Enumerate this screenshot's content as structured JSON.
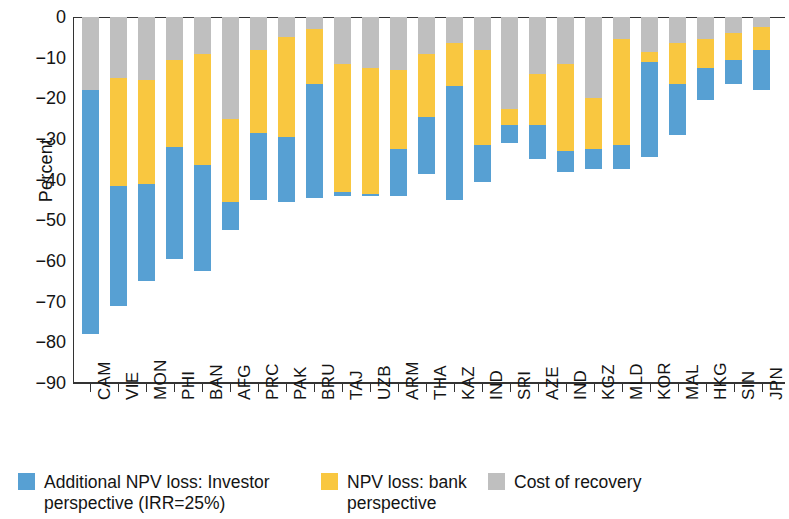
{
  "chart_data": {
    "type": "bar",
    "stacked": true,
    "orientation": "vertical",
    "title": "",
    "xlabel": "",
    "ylabel": "Percent",
    "ylim": [
      -90,
      0
    ],
    "yticks": [
      "0",
      "−10",
      "−20",
      "−30",
      "−40",
      "−50",
      "−60",
      "−70",
      "−80",
      "−90"
    ],
    "ytick_values": [
      0,
      -10,
      -20,
      -30,
      -40,
      -50,
      -60,
      -70,
      -80,
      -90
    ],
    "grid": false,
    "legend_position": "bottom",
    "categories": [
      "CAM",
      "VIE",
      "MON",
      "PHI",
      "BAN",
      "AFG",
      "PRC",
      "PAK",
      "BRU",
      "TAJ",
      "UZB",
      "ARM",
      "THA",
      "KAZ",
      "IND",
      "SRI",
      "AZE",
      "IND",
      "KGZ",
      "MLD",
      "KOR",
      "MAL",
      "HKG",
      "SIN",
      "JPN"
    ],
    "series": [
      {
        "name": "Cost of recovery",
        "color": "#bfbfbf",
        "values": [
          -18,
          -15,
          -15.5,
          -10.5,
          -9,
          -25,
          -8,
          -5,
          -3,
          -11.5,
          -12.5,
          -13,
          -9,
          -6.5,
          -8,
          -22.5,
          -14,
          -11.5,
          -20,
          -5.5,
          -8.5,
          -6.5,
          -5.5,
          -4,
          -2.5
        ]
      },
      {
        "name": "NPV loss: bank perspective",
        "color": "#f9c740",
        "values": [
          0,
          -26.5,
          -25.5,
          -21.5,
          -27.5,
          -20.5,
          -20.5,
          -24.5,
          -13.5,
          -31.5,
          -31,
          -19.5,
          -15.5,
          -10.5,
          -23.5,
          -4,
          -12.5,
          -21.5,
          -12.5,
          -26,
          -2.5,
          -10,
          -7,
          -6.5,
          -5.5
        ]
      },
      {
        "name": "Additional NPV loss: Investor perspective (IRR=25%)",
        "color": "#57a0d3",
        "values": [
          -60,
          -29.5,
          -24,
          -27.5,
          -26,
          -7,
          -16.5,
          -16,
          -28,
          -1,
          -0.5,
          -11.5,
          -14,
          -28,
          -9,
          -4.5,
          -8.5,
          -5,
          -5,
          -6,
          -23.5,
          -12.5,
          -8,
          -6,
          -10
        ]
      }
    ],
    "bar_totals": [
      -78,
      -71,
      -65,
      -59.5,
      -62.5,
      -52.5,
      -45,
      -45.5,
      -44.5,
      -44,
      -44,
      -44,
      -38.5,
      -45,
      -40.5,
      -31,
      -35,
      -38,
      -37.5,
      -37.5,
      -34.5,
      -29,
      -20.5,
      -16.5,
      -18
    ]
  },
  "legend": {
    "items": [
      {
        "label": "Additional NPV loss: Investor perspective (IRR=25%)",
        "color": "#57a0d3"
      },
      {
        "label": "NPV loss: bank perspective",
        "color": "#f9c740"
      },
      {
        "label": "Cost of recovery",
        "color": "#bfbfbf"
      }
    ]
  }
}
